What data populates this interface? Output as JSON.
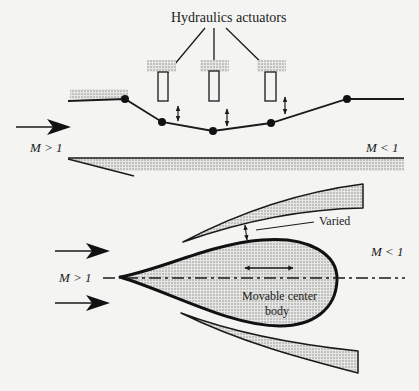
{
  "diagram": {
    "top_panel": {
      "label_actuators": "Hydraulics actuators",
      "inflow_label": "M > 1",
      "outflow_label": "M < 1",
      "actuator_count": 3,
      "hinge_count": 5
    },
    "bottom_panel": {
      "inflow_label": "M > 1",
      "outflow_label": "M < 1",
      "gap_label": "Varied",
      "center_body_label_line1": "Movable center",
      "center_body_label_line2": "body"
    },
    "colors": {
      "stroke": "#1a1a1a",
      "hatch_fill": "#bdbdbd",
      "background": "#f4f4f2"
    }
  }
}
